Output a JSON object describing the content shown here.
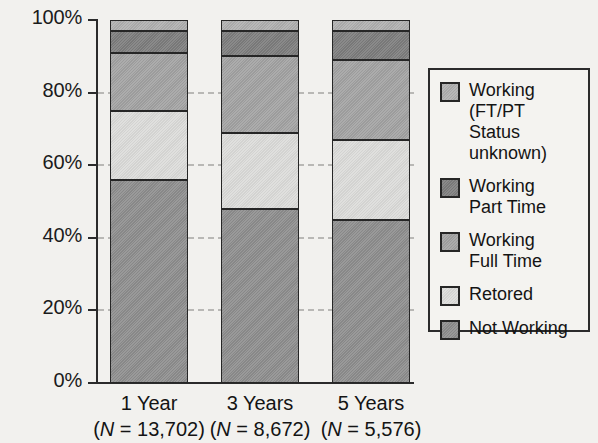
{
  "chart_data": {
    "type": "bar",
    "subtype": "stacked-percentage",
    "title": "",
    "xlabel": "",
    "ylabel": "",
    "ylim": [
      0,
      100
    ],
    "yticks": [
      "0%",
      "20%",
      "40%",
      "60%",
      "80%",
      "100%"
    ],
    "ytick_values": [
      0,
      20,
      40,
      60,
      80,
      100
    ],
    "grid": true,
    "grid_style": "dashed horizontal",
    "legend_position": "right",
    "categories": [
      "1 Year",
      "3 Years",
      "5 Years"
    ],
    "category_sublabels": [
      "(N = 13,702)",
      "(N = 8,672)",
      "(N = 5,576)"
    ],
    "category_n": [
      13702,
      8672,
      5576
    ],
    "series": [
      {
        "name": "Not Working",
        "color": "#8e8e8e",
        "values": [
          56,
          48,
          45
        ]
      },
      {
        "name": "Retored",
        "color": "#dcdcda",
        "values": [
          19,
          21,
          22
        ]
      },
      {
        "name": "Working Full Time",
        "color": "#a3a3a3",
        "values": [
          16,
          21,
          22
        ]
      },
      {
        "name": "Working Part Time",
        "color": "#7d7d7d",
        "values": [
          6,
          7,
          8
        ]
      },
      {
        "name": "Working (FT/PT Status unknown)",
        "color": "#b0b0b0",
        "values": [
          3,
          3,
          3
        ]
      }
    ],
    "stack_order_bottom_to_top": [
      "Not Working",
      "Retored",
      "Working Full Time",
      "Working Part Time",
      "Working (FT/PT Status unknown)"
    ]
  },
  "axis": {
    "y_labels": [
      {
        "text": "100%",
        "value": 100
      },
      {
        "text": "80%",
        "value": 80
      },
      {
        "text": "60%",
        "value": 60
      },
      {
        "text": "40%",
        "value": 40
      },
      {
        "text": "20%",
        "value": 20
      },
      {
        "text": "0%",
        "value": 0
      }
    ]
  },
  "bars": [
    {
      "label": "1 Year",
      "n_label_prefix": "(",
      "n_label_italic": "N",
      "n_label_suffix": " = 13,702)",
      "segments": [
        {
          "name": "Working (FT/PT Status unknown)",
          "value": 3,
          "from": 97,
          "to": 100,
          "fill": "f-unknown"
        },
        {
          "name": "Working Part Time",
          "value": 6,
          "from": 91,
          "to": 97,
          "fill": "f-part"
        },
        {
          "name": "Working Full Time",
          "value": 16,
          "from": 75,
          "to": 91,
          "fill": "f-full"
        },
        {
          "name": "Retored",
          "value": 19,
          "from": 56,
          "to": 75,
          "fill": "f-ret"
        },
        {
          "name": "Not Working",
          "value": 56,
          "from": 0,
          "to": 56,
          "fill": "f-not"
        }
      ]
    },
    {
      "label": "3 Years",
      "n_label_prefix": "(",
      "n_label_italic": "N",
      "n_label_suffix": " = 8,672)",
      "segments": [
        {
          "name": "Working (FT/PT Status unknown)",
          "value": 3,
          "from": 97,
          "to": 100,
          "fill": "f-unknown"
        },
        {
          "name": "Working Part Time",
          "value": 7,
          "from": 90,
          "to": 97,
          "fill": "f-part"
        },
        {
          "name": "Working Full Time",
          "value": 21,
          "from": 69,
          "to": 90,
          "fill": "f-full"
        },
        {
          "name": "Retored",
          "value": 21,
          "from": 48,
          "to": 69,
          "fill": "f-ret"
        },
        {
          "name": "Not Working",
          "value": 48,
          "from": 0,
          "to": 48,
          "fill": "f-not"
        }
      ]
    },
    {
      "label": "5 Years",
      "n_label_prefix": "(",
      "n_label_italic": "N",
      "n_label_suffix": " = 5,576)",
      "segments": [
        {
          "name": "Working (FT/PT Status unknown)",
          "value": 3,
          "from": 97,
          "to": 100,
          "fill": "f-unknown"
        },
        {
          "name": "Working Part Time",
          "value": 8,
          "from": 89,
          "to": 97,
          "fill": "f-part"
        },
        {
          "name": "Working Full Time",
          "value": 22,
          "from": 67,
          "to": 89,
          "fill": "f-full"
        },
        {
          "name": "Retored",
          "value": 22,
          "from": 45,
          "to": 67,
          "fill": "f-ret"
        },
        {
          "name": "Not Working",
          "value": 45,
          "from": 0,
          "to": 45,
          "fill": "f-not"
        }
      ]
    }
  ],
  "legend": {
    "items": [
      {
        "label": "Working (FT/PT\nStatus unknown)",
        "fill": "f-unknown"
      },
      {
        "label": "Working\nPart Time",
        "fill": "f-part"
      },
      {
        "label": "Working\nFull Time",
        "fill": "f-full"
      },
      {
        "label": "Retored",
        "fill": "f-ret"
      },
      {
        "label": "Not Working",
        "fill": "f-not"
      }
    ]
  }
}
